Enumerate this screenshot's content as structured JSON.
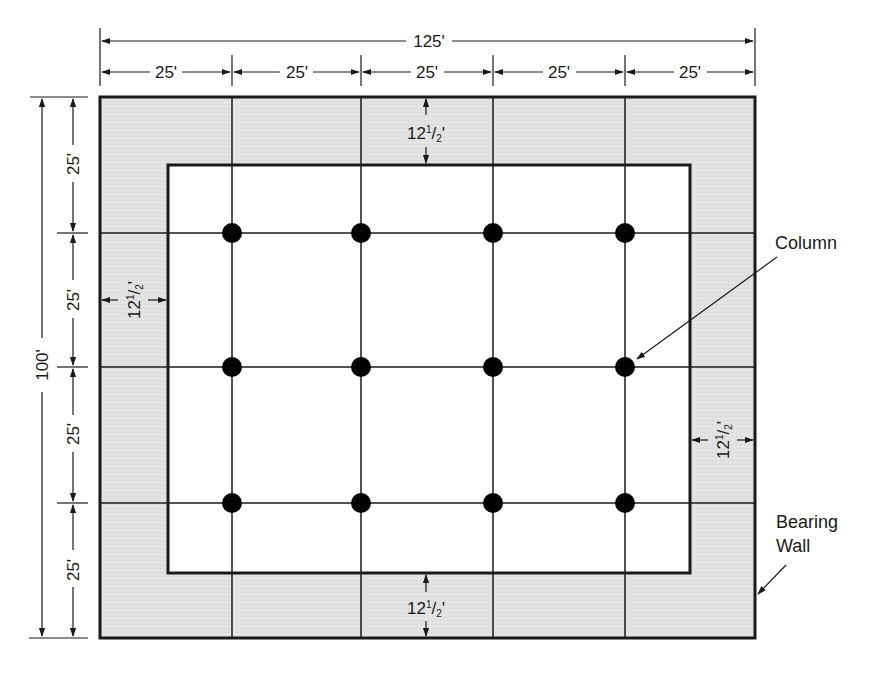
{
  "diagram": {
    "type": "structural-floor-plan",
    "colors": {
      "wall_fill": "#e2e2e2",
      "line": "#1a1a1a",
      "background": "#ffffff",
      "column": "#000000"
    },
    "overall_dimensions": {
      "width_label": "125'",
      "height_label": "100'"
    },
    "bay_dimensions": {
      "horizontal": [
        "25'",
        "25'",
        "25'",
        "25'",
        "25'"
      ],
      "vertical": [
        "25'",
        "25'",
        "25'",
        "25'"
      ]
    },
    "setback_dimensions": {
      "top": {
        "whole": "12",
        "num": "1",
        "den": "2",
        "unit": "'"
      },
      "bottom": {
        "whole": "12",
        "num": "1",
        "den": "2",
        "unit": "'"
      },
      "left": {
        "whole": "12",
        "num": "1",
        "den": "2",
        "unit": "'"
      },
      "right": {
        "whole": "12",
        "num": "1",
        "den": "2",
        "unit": "'"
      }
    },
    "callouts": {
      "column": "Column",
      "bearing_wall_line1": "Bearing",
      "bearing_wall_line2": "Wall"
    },
    "grid": {
      "columns_x": 4,
      "columns_y": 3,
      "column_count": 12
    }
  }
}
